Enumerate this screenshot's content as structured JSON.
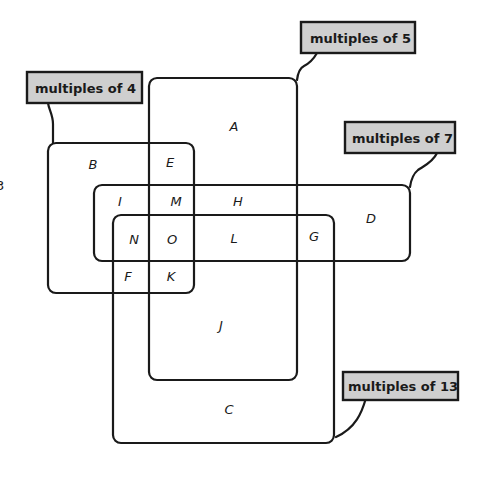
{
  "diagram": {
    "type": "venn-rectangles",
    "sets": [
      {
        "id": "m4",
        "label": "multiples of 4"
      },
      {
        "id": "m5",
        "label": "multiples of 5"
      },
      {
        "id": "m7",
        "label": "multiples of 7"
      },
      {
        "id": "m13",
        "label": "multiples of 13"
      }
    ],
    "regions": {
      "A": "A",
      "B": "B",
      "C": "C",
      "D": "D",
      "E": "E",
      "F": "F",
      "G": "G",
      "H": "H",
      "I": "I",
      "J": "J",
      "K": "K",
      "L": "L",
      "M": "M",
      "N": "N",
      "O": "O"
    },
    "stray_mark": "3"
  }
}
